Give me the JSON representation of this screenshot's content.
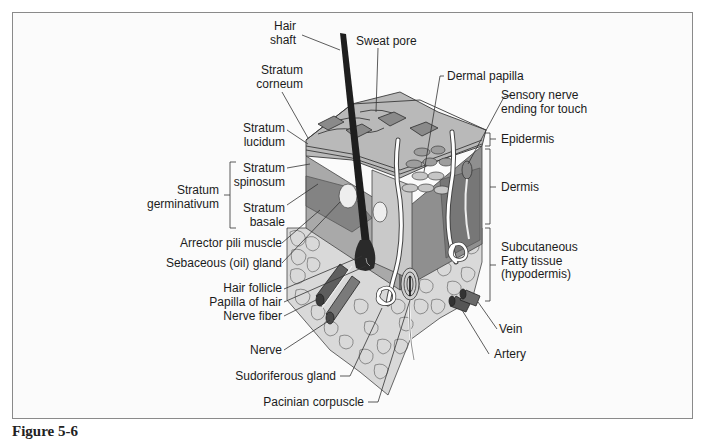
{
  "figure": {
    "caption": "Figure 5-6"
  },
  "labels_left": {
    "hair_shaft": "Hair\nshaft",
    "stratum_corneum": "Stratum\ncorneum",
    "stratum_lucidum": "Stratum\nlucidum",
    "stratum_spinosum": "Stratum\nspinosum",
    "stratum_germinativum": "Stratum\ngerminativum",
    "stratum_basale": "Stratum\nbasale",
    "arrector_pili": "Arrector pili muscle",
    "sebaceous_gland": "Sebaceous (oil) gland",
    "hair_follicle": "Hair follicle",
    "papilla_of_hair": "Papilla of hair",
    "nerve_fiber": "Nerve fiber",
    "nerve": "Nerve",
    "sudoriferous_gland": "Sudoriferous gland",
    "pacinian_corpuscle": "Pacinian corpuscle"
  },
  "labels_top": {
    "sweat_pore": "Sweat pore",
    "dermal_papilla": "Dermal papilla",
    "sensory_nerve": "Sensory nerve\nending for touch"
  },
  "labels_right": {
    "epidermis": "Epidermis",
    "dermis": "Dermis",
    "subcutaneous": "Subcutaneous\nFatty tissue\n(hypodermis)",
    "vein": "Vein",
    "artery": "Artery"
  },
  "colors": {
    "frame_border": "#8a8a8a",
    "background": "#fbfbfb",
    "epidermis": "#b8b8b8",
    "dermis": "#9a9a9a",
    "dermis_dark": "#7d7d7d",
    "fat": "#d6d6d6",
    "hair": "#1e1e1e",
    "line": "#333333"
  }
}
